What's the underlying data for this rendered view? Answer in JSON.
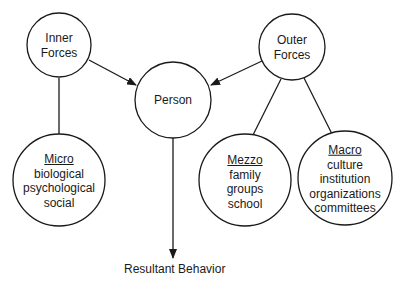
{
  "diagram": {
    "nodes": {
      "inner_forces": {
        "lines": [
          "Inner",
          "Forces"
        ]
      },
      "outer_forces": {
        "lines": [
          "Outer",
          "Forces"
        ]
      },
      "person": {
        "label": "Person"
      },
      "micro": {
        "title": "Micro",
        "items": [
          "biological",
          "psychological",
          "social"
        ]
      },
      "mezzo": {
        "title": "Mezzo",
        "items": [
          "family",
          "groups",
          "school"
        ]
      },
      "macro": {
        "title": "Macro",
        "items": [
          "culture",
          "institution",
          "organizations",
          "committees"
        ]
      }
    },
    "result_label": "Resultant Behavior",
    "edges": [
      {
        "from": "inner_forces",
        "to": "person",
        "arrow": true
      },
      {
        "from": "outer_forces",
        "to": "person",
        "arrow": true
      },
      {
        "from": "inner_forces",
        "to": "micro",
        "arrow": false
      },
      {
        "from": "outer_forces",
        "to": "mezzo",
        "arrow": false
      },
      {
        "from": "outer_forces",
        "to": "macro",
        "arrow": false
      },
      {
        "from": "person",
        "to": "result",
        "arrow": true
      }
    ]
  }
}
